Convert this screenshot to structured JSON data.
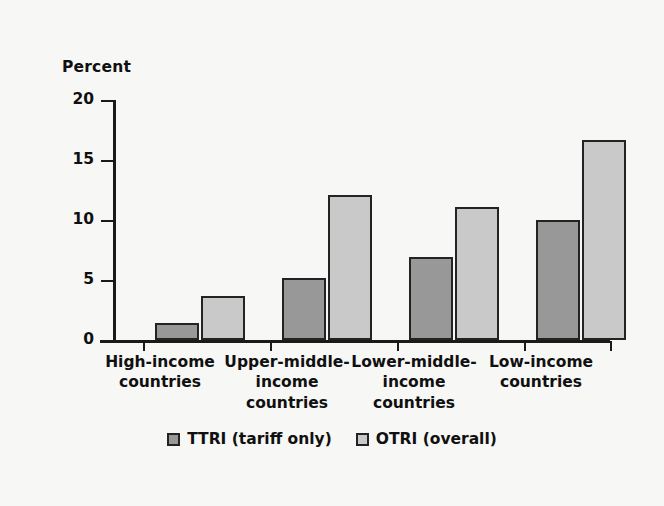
{
  "chart_data": {
    "type": "bar",
    "title": "",
    "subtitle": "",
    "xlabel": "",
    "ylabel": "Percent",
    "ylim": [
      0,
      20
    ],
    "yticks": [
      0,
      5,
      10,
      15,
      20
    ],
    "ytick_labels": [
      "0",
      "5",
      "10",
      "15",
      "20"
    ],
    "grid": false,
    "legend_position": "bottom-center",
    "categories": [
      "High-income countries",
      "Upper-middle-income countries",
      "Lower-middle-income countries",
      "Low-income countries"
    ],
    "category_lines": [
      [
        "High-income",
        "countries"
      ],
      [
        "Upper-middle-",
        "income",
        "countries"
      ],
      [
        "Lower-middle-",
        "income",
        "countries"
      ],
      [
        "Low-income",
        "countries"
      ]
    ],
    "series": [
      {
        "name": "TTRI (tariff only)",
        "color": "#989898",
        "values": [
          1.4,
          5.2,
          6.9,
          10.0
        ]
      },
      {
        "name": "OTRI (overall)",
        "color": "#c9c9c9",
        "values": [
          3.7,
          12.1,
          11.1,
          16.7
        ]
      }
    ]
  },
  "colors": {
    "background": "#f7f7f5",
    "axis": "#1a1a1a",
    "text": "#101010",
    "bar_edge": "#232323",
    "ttri": "#989898",
    "otri": "#c9c9c9"
  }
}
